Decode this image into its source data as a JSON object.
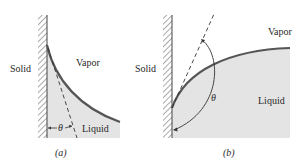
{
  "figure": {
    "panels": [
      {
        "id": "a",
        "caption": "(a)",
        "labels": {
          "solid": "Solid",
          "vapor": "Vapor",
          "liquid": "Liquid",
          "angle": "θ"
        },
        "description": "Contact angle θ less than 90°: liquid wets the solid wall"
      },
      {
        "id": "b",
        "caption": "(b)",
        "labels": {
          "solid": "Solid",
          "vapor": "Vapor",
          "liquid": "Liquid",
          "angle": "θ"
        },
        "description": "Contact angle θ greater than 90°: liquid does not wet the solid wall"
      }
    ],
    "colors": {
      "liquid_fill": "#e4e4e4",
      "interface": "#555555",
      "wall": "#444444",
      "text": "#2a2a2a"
    }
  }
}
